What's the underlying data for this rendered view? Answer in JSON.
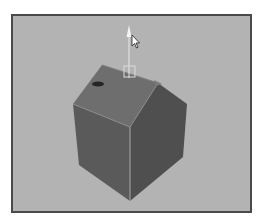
{
  "viewport": {
    "background": "#b3b3b3",
    "border": "#4a4a4a"
  },
  "scene": {
    "object": "house-mesh",
    "colors": {
      "roof": "#6e6e6e",
      "left_wall": "#5a5a5a",
      "right_wall": "#4e4e4e",
      "edge_highlight": "#a8a8a8",
      "manipulator": "#e8e8e8"
    }
  },
  "manipulator": {
    "type": "move-y-axis",
    "icon": "arrow-up-icon"
  },
  "cursor": {
    "icon": "mouse-pointer-icon"
  }
}
